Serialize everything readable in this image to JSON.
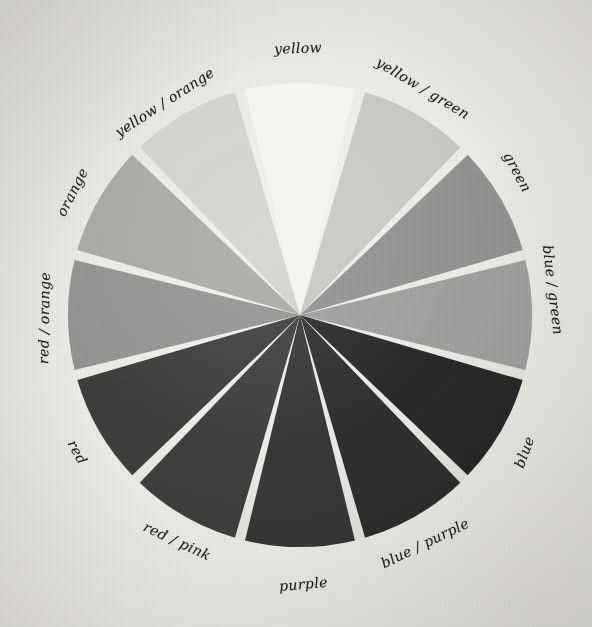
{
  "image": {
    "title": "Color Wheel",
    "subject": "twelve-segment hand-labelled colour wheel photographed on textured paper",
    "background_color": "#eeece6",
    "label_ink_color": "#1d1c1a",
    "gap_color": "#eeece6",
    "center_x": 300,
    "center_y": 315,
    "radius": 232
  },
  "chart_data": {
    "type": "pie",
    "xlabel": "",
    "ylabel": "",
    "legend_position": "around-perimeter",
    "grid": false,
    "segment_count": 12,
    "equal_segments": true,
    "segment_degrees": 30,
    "gap_degrees": 2.6,
    "categories": [
      "yellow",
      "yellow / green",
      "green",
      "blue / green",
      "blue",
      "blue / purple",
      "purple",
      "red / pink",
      "red",
      "red / orange",
      "orange",
      "yellow / orange"
    ],
    "values": [
      1,
      1,
      1,
      1,
      1,
      1,
      1,
      1,
      1,
      1,
      1,
      1
    ],
    "colors": [
      "#f4f3ef",
      "#c6c5c1",
      "#8d8d8b",
      "#9b9b99",
      "#242424",
      "#2b2a2a",
      "#343333",
      "#3b3a39",
      "#3a3938",
      "#8f8f8d",
      "#a6a5a2",
      "#d1d0cc"
    ]
  },
  "wheel": {
    "segments": [
      {
        "label": "yellow",
        "color": "#f4f3ef",
        "start_angle": -15,
        "end_angle": 15,
        "label_x": 298,
        "label_y": 48,
        "label_rotate": -2
      },
      {
        "label": "yellow / green",
        "color": "#c6c5c1",
        "start_angle": 15,
        "end_angle": 45,
        "label_x": 423,
        "label_y": 88,
        "label_rotate": 31
      },
      {
        "label": "green",
        "color": "#8d8d8b",
        "start_angle": 45,
        "end_angle": 75,
        "label_x": 517,
        "label_y": 172,
        "label_rotate": 62
      },
      {
        "label": "blue / green",
        "color": "#9b9b99",
        "start_angle": 75,
        "end_angle": 105,
        "label_x": 553,
        "label_y": 290,
        "label_rotate": 83
      },
      {
        "label": "blue",
        "color": "#242424",
        "start_angle": 105,
        "end_angle": 135,
        "label_x": 524,
        "label_y": 452,
        "label_rotate": 290
      },
      {
        "label": "blue / purple",
        "color": "#2b2a2a",
        "start_angle": 135,
        "end_angle": 165,
        "label_x": 425,
        "label_y": 543,
        "label_rotate": 334
      },
      {
        "label": "purple",
        "color": "#343333",
        "start_angle": 165,
        "end_angle": 195,
        "label_x": 303,
        "label_y": 584,
        "label_rotate": 355
      },
      {
        "label": "red / pink",
        "color": "#3b3a39",
        "start_angle": 195,
        "end_angle": 225,
        "label_x": 177,
        "label_y": 541,
        "label_rotate": 25
      },
      {
        "label": "red",
        "color": "#3a3938",
        "start_angle": 225,
        "end_angle": 255,
        "label_x": 77,
        "label_y": 452,
        "label_rotate": 62
      },
      {
        "label": "red / orange",
        "color": "#8f8f8d",
        "start_angle": 255,
        "end_angle": 285,
        "label_x": 44,
        "label_y": 318,
        "label_rotate": 271
      },
      {
        "label": "orange",
        "color": "#a6a5a2",
        "start_angle": 285,
        "end_angle": 315,
        "label_x": 72,
        "label_y": 192,
        "label_rotate": 297
      },
      {
        "label": "yellow / orange",
        "color": "#d1d0cc",
        "start_angle": 315,
        "end_angle": 345,
        "label_x": 164,
        "label_y": 102,
        "label_rotate": 327
      }
    ]
  }
}
